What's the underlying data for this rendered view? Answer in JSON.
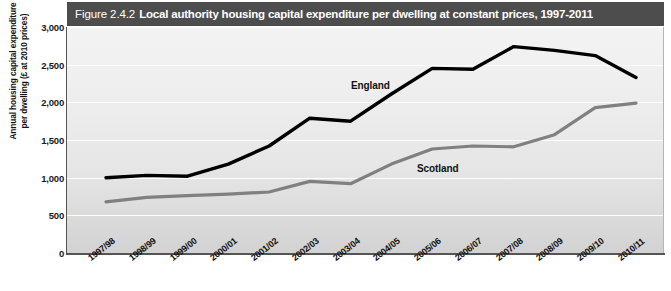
{
  "header": {
    "figure_number": "Figure 2.4.2",
    "title": "Local authority housing capital expenditure per dwelling at constant prices, 1997-2011"
  },
  "axes": {
    "y_title_line1": "Annual housing capital expenditure",
    "y_title_line2": "per dwelling (£ at 2010 prices)",
    "y_ticks": [
      "3,000",
      "2,500",
      "2,000",
      "1,500",
      "1,000",
      "500",
      "0"
    ],
    "x_ticks": [
      "1997/98",
      "1998/99",
      "1999/00",
      "2000/01",
      "2001/02",
      "2002/03",
      "2003/04",
      "2004/05",
      "2005/06",
      "2006/07",
      "2007/08",
      "2008/09",
      "2009/10",
      "2010/11"
    ]
  },
  "series_labels": {
    "england": "England",
    "scotland": "Scotland"
  },
  "colors": {
    "header_bar": "#4d4d4d",
    "header_text": "#ffffff",
    "plot_background": "#e9e9e9",
    "gridline": "#ffffff",
    "england_line": "#000000",
    "scotland_line": "#808080",
    "axis_line": "#555555"
  },
  "chart_data": {
    "type": "line",
    "title": "Local authority housing capital expenditure per dwelling at constant prices, 1997-2011",
    "xlabel": "",
    "ylabel": "Annual housing capital expenditure per dwelling (£ at 2010 prices)",
    "categories": [
      "1997/98",
      "1998/99",
      "1999/00",
      "2000/01",
      "2001/02",
      "2002/03",
      "2003/04",
      "2004/05",
      "2005/06",
      "2006/07",
      "2007/08",
      "2008/09",
      "2009/10",
      "2010/11"
    ],
    "series": [
      {
        "name": "England",
        "color": "#000000",
        "values": [
          1000,
          1030,
          1020,
          1180,
          1420,
          1790,
          1750,
          2110,
          2450,
          2440,
          2740,
          2690,
          2620,
          2330
        ]
      },
      {
        "name": "Scotland",
        "color": "#808080",
        "values": [
          680,
          740,
          760,
          780,
          810,
          950,
          920,
          1180,
          1380,
          1420,
          1410,
          1570,
          1930,
          1990
        ]
      }
    ],
    "ylim": [
      0,
      3000
    ],
    "yticks": [
      0,
      500,
      1000,
      1500,
      2000,
      2500,
      3000
    ],
    "grid": true,
    "legend": "inline-annotations"
  }
}
